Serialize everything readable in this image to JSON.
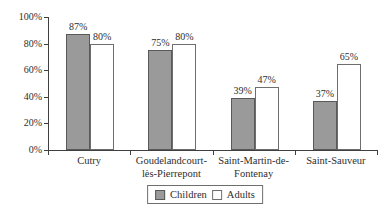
{
  "chart_data": {
    "type": "bar",
    "title": "",
    "categories": [
      "Cutry",
      "Goudelandcourt-lès-Pierrepont",
      "Saint-Martin-de-Fontenay",
      "Saint-Sauveur"
    ],
    "category_label_lines": [
      [
        "Cutry"
      ],
      [
        "Goudelandcourt-",
        "lès-Pierrepont"
      ],
      [
        "Saint-Martin-de-",
        "Fontenay"
      ],
      [
        "Saint-Sauveur"
      ]
    ],
    "series": [
      {
        "name": "Children",
        "values": [
          87,
          75,
          39,
          37
        ],
        "fill": "#9a9a9a",
        "border": "#595959"
      },
      {
        "name": "Adults",
        "values": [
          80,
          80,
          47,
          65
        ],
        "fill": "#ffffff",
        "border": "#6e6e6e"
      }
    ],
    "data_labels": [
      [
        "87%",
        "75%",
        "39%",
        "37%"
      ],
      [
        "80%",
        "80%",
        "47%",
        "65%"
      ]
    ],
    "unit": "%",
    "y_ticks": [
      "0%",
      "20%",
      "40%",
      "60%",
      "80%",
      "100%"
    ],
    "y_tick_values": [
      0,
      20,
      40,
      60,
      80,
      100
    ],
    "ylim": [
      0,
      100
    ],
    "grid": false,
    "legend_position": "bottom",
    "legend": {
      "children_label": "Children",
      "adults_label": "Adults"
    },
    "colors": {
      "axis": "#3f3f3f",
      "text": "#2e2e2e",
      "children_fill": "#9a9a9a",
      "adults_fill": "#ffffff"
    }
  }
}
